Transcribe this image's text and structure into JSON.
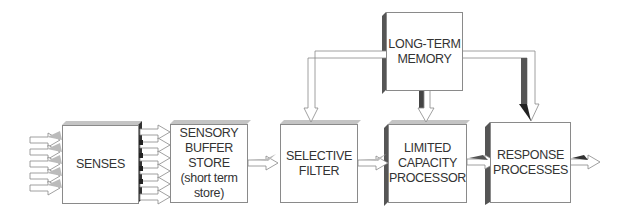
{
  "diagram": {
    "boxes": [
      {
        "id": "senses",
        "label": "SENSES"
      },
      {
        "id": "sensory-buffer",
        "label": "SENSORY\nBUFFER\nSTORE\n(short term\nstore)"
      },
      {
        "id": "selective-filter",
        "label": "SELECTIVE\nFILTER"
      },
      {
        "id": "long-term-memory",
        "label": "LONG-TERM\nMEMORY"
      },
      {
        "id": "limited-capacity",
        "label": "LIMITED\nCAPACITY\nPROCESSOR"
      },
      {
        "id": "response",
        "label": "RESPONSE\nPROCESSES"
      }
    ],
    "edges": [
      {
        "from": "input",
        "to": "senses",
        "count": 5
      },
      {
        "from": "senses",
        "to": "sensory-buffer",
        "count": 6
      },
      {
        "from": "sensory-buffer",
        "to": "selective-filter"
      },
      {
        "from": "selective-filter",
        "to": "limited-capacity"
      },
      {
        "from": "limited-capacity",
        "to": "response"
      },
      {
        "from": "response",
        "to": "output"
      },
      {
        "from": "long-term-memory",
        "to": "selective-filter"
      },
      {
        "from": "long-term-memory",
        "to": "limited-capacity"
      },
      {
        "from": "long-term-memory",
        "to": "response"
      }
    ],
    "colors": {
      "border": "#8a8a8a",
      "shadow": "#b8b8b8",
      "dark": "#333333",
      "text": "#333333"
    }
  }
}
